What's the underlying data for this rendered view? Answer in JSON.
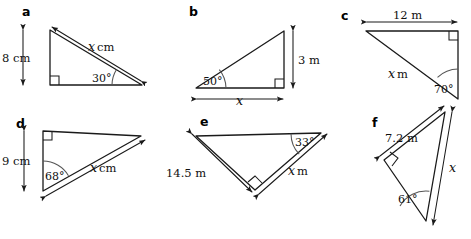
{
  "worksheet": {
    "background_color": "#ffffff",
    "line_color": "#1a1a1a",
    "arc_color": "#555555",
    "panels": [
      {
        "letter": "a",
        "side_label": "8 cm",
        "hyp_value": "x",
        "hyp_unit": "cm",
        "angle": "30°",
        "right_angle": true
      },
      {
        "letter": "b",
        "side_label": "3 m",
        "hyp_value": "x",
        "hyp_unit": "",
        "angle": "50°",
        "right_angle": true
      },
      {
        "letter": "c",
        "side_label": "12 m",
        "hyp_value": "x",
        "hyp_unit": "m",
        "angle": "70°",
        "right_angle": true
      },
      {
        "letter": "d",
        "side_label": "9 cm",
        "hyp_value": "x",
        "hyp_unit": "cm",
        "angle": "68°",
        "right_angle": true
      },
      {
        "letter": "e",
        "side_label": "14.5 m",
        "hyp_value": "x",
        "hyp_unit": "m",
        "angle": "33°",
        "right_angle": true
      },
      {
        "letter": "f",
        "side_label": "7.2 m",
        "hyp_value": "x",
        "hyp_unit": "",
        "angle": "61°",
        "right_angle": true
      }
    ]
  }
}
